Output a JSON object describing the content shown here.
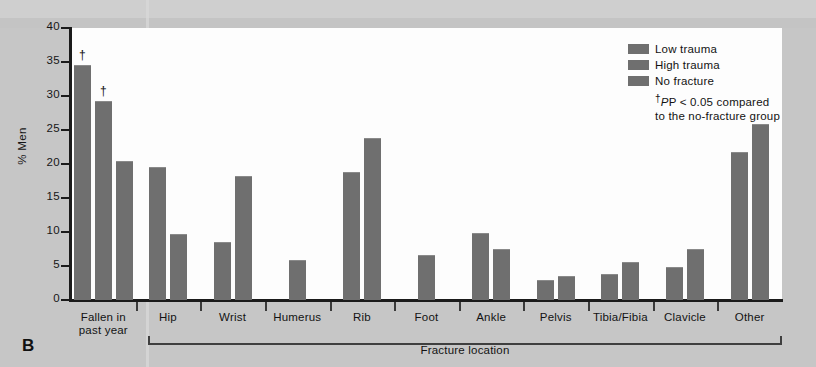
{
  "figure": {
    "panel_label": "B",
    "ylabel": "% Men",
    "xlabel": "Fracture location",
    "footnote_line1": "P < 0.05 compared",
    "footnote_line2": "to the no-fracture group",
    "footnote_marker": "†",
    "significance_marker": "†"
  },
  "legend": {
    "position": "top-right",
    "items": [
      {
        "label": "Low trauma",
        "color": "#6f6f6f"
      },
      {
        "label": "High trauma",
        "color": "#6f6f6f"
      },
      {
        "label": "No fracture",
        "color": "#6f6f6f"
      }
    ]
  },
  "chart_data": {
    "type": "bar",
    "title": "",
    "xlabel": "Fracture location",
    "ylabel": "% Men",
    "ylim": [
      0,
      40
    ],
    "yticks": [
      0,
      5,
      10,
      15,
      20,
      25,
      30,
      35,
      40
    ],
    "ytick_labels": [
      "0",
      "5",
      "10",
      "15",
      "20",
      "25",
      "30",
      "35",
      "40"
    ],
    "grid": false,
    "legend_position": "top-right",
    "categories": [
      "Fallen in past year",
      "Hip",
      "Wrist",
      "Humerus",
      "Rib",
      "Foot",
      "Ankle",
      "Pelvis",
      "Tibia/Fibia",
      "Clavicle",
      "Other"
    ],
    "category_label_lines": [
      [
        "Fallen in",
        "past year"
      ],
      [
        "Hip"
      ],
      [
        "Wrist"
      ],
      [
        "Humerus"
      ],
      [
        "Rib"
      ],
      [
        "Foot"
      ],
      [
        "Ankle"
      ],
      [
        "Pelvis"
      ],
      [
        "Tibia/Fibia"
      ],
      [
        "Clavicle"
      ],
      [
        "Other"
      ]
    ],
    "series": [
      {
        "name": "Low trauma",
        "values": [
          34.5,
          19.5,
          8.5,
          5.9,
          18.8,
          6.6,
          9.8,
          3.0,
          3.8,
          4.8,
          21.8
        ]
      },
      {
        "name": "High trauma",
        "values": [
          29.2,
          9.7,
          18.3,
          null,
          23.8,
          null,
          7.5,
          3.5,
          5.6,
          7.5,
          25.9
        ]
      },
      {
        "name": "No fracture",
        "values": [
          20.4,
          null,
          null,
          null,
          null,
          null,
          null,
          null,
          null,
          null,
          null
        ]
      }
    ],
    "annotations": [
      {
        "category": "Fallen in past year",
        "series": "Low trauma",
        "marker": "†",
        "value": 34.5
      },
      {
        "category": "Fallen in past year",
        "series": "High trauma",
        "marker": "†",
        "value": 29.2
      }
    ]
  }
}
